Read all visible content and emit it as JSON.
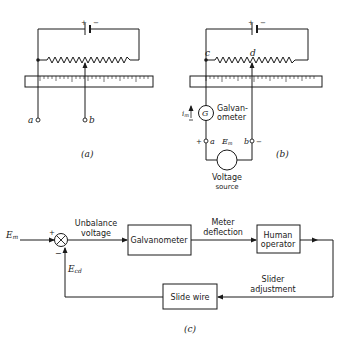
{
  "figure_a": {
    "caption": "(a)",
    "battery_plus": "+",
    "battery_minus": "−",
    "terminal_a": "a",
    "terminal_b": "b"
  },
  "figure_b": {
    "caption": "(b)",
    "battery_plus": "+",
    "battery_minus": "−",
    "node_c": "c",
    "node_d": "d",
    "galvanometer_symbol": "G",
    "galvanometer_label_1": "Galvan-",
    "galvanometer_label_2": "ometer",
    "current_label": "i",
    "current_sub": "m",
    "terminal_a_sign": "+",
    "terminal_a": "a",
    "terminal_b": "b",
    "terminal_b_sign": "−",
    "emf_label": "E",
    "emf_sub": "m",
    "source_label_1": "Voltage",
    "source_label_2": "source"
  },
  "figure_c": {
    "caption": "(c)",
    "input_label": "E",
    "input_sub": "m",
    "plus_sign": "+",
    "minus_sign": "−",
    "unbalance_1": "Unbalance",
    "unbalance_2": "voltage",
    "galvanometer_block": "Galvanometer",
    "meter_1": "Meter",
    "meter_2": "deflection",
    "human_1": "Human",
    "human_2": "operator",
    "slider_1": "Slider",
    "slider_2": "adjustment",
    "slide_wire_block": "Slide wire",
    "feedback_label": "E",
    "feedback_sub": "cd"
  }
}
